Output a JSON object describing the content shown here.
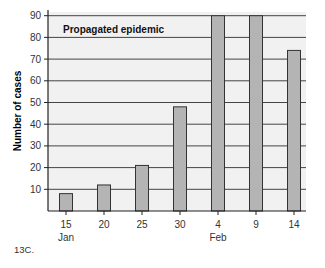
{
  "chart_data": {
    "type": "bar",
    "title": "Propagated epidemic",
    "xlabel": "",
    "ylabel": "Number of cases",
    "categories": [
      "15",
      "20",
      "25",
      "30",
      "4",
      "9",
      "14"
    ],
    "category_sublabels": {
      "15": "Jan",
      "4": "Feb"
    },
    "values": [
      8,
      12,
      21,
      48,
      90,
      90,
      74
    ],
    "ylim": [
      0,
      92
    ],
    "yticks": [
      10,
      20,
      30,
      40,
      50,
      60,
      70,
      80,
      90
    ],
    "grid": true,
    "bar_color": "#b4b4b4",
    "plot_background": "#f1f1f1"
  },
  "caption": "13C."
}
